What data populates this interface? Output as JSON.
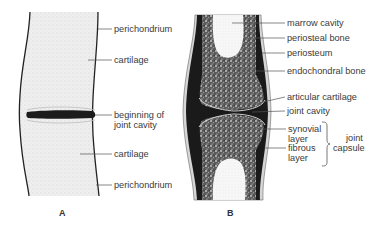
{
  "figure": {
    "panel_a": {
      "letter": "A",
      "labels": {
        "perichondrium_top": "perichondrium",
        "cartilage_top": "cartilage",
        "beginning_line1": "beginning of",
        "beginning_line2": "joint cavity",
        "cartilage_bottom": "cartilage",
        "perichondrium_bottom": "perichondrium"
      }
    },
    "panel_b": {
      "letter": "B",
      "labels": {
        "marrow_cavity": "marrow cavity",
        "periosteal_bone": "periosteal bone",
        "periosteum": "periosteum",
        "endochondral_bone": "endochondral bone",
        "articular_cartilage": "articular cartilage",
        "joint_cavity": "joint cavity",
        "synovial_line1": "synovial",
        "synovial_line2": "layer",
        "fibrous_line1": "fibrous",
        "fibrous_line2": "layer",
        "capsule_line1": "joint",
        "capsule_line2": "capsule"
      }
    },
    "colors": {
      "cartilage_fill": "#ececec",
      "bone_fill": "#4a4a4a",
      "dark_band": "#1a1a1a",
      "marrow_fill": "#f4f4f4",
      "outline": "#222222",
      "leader_line": "#555555"
    }
  }
}
